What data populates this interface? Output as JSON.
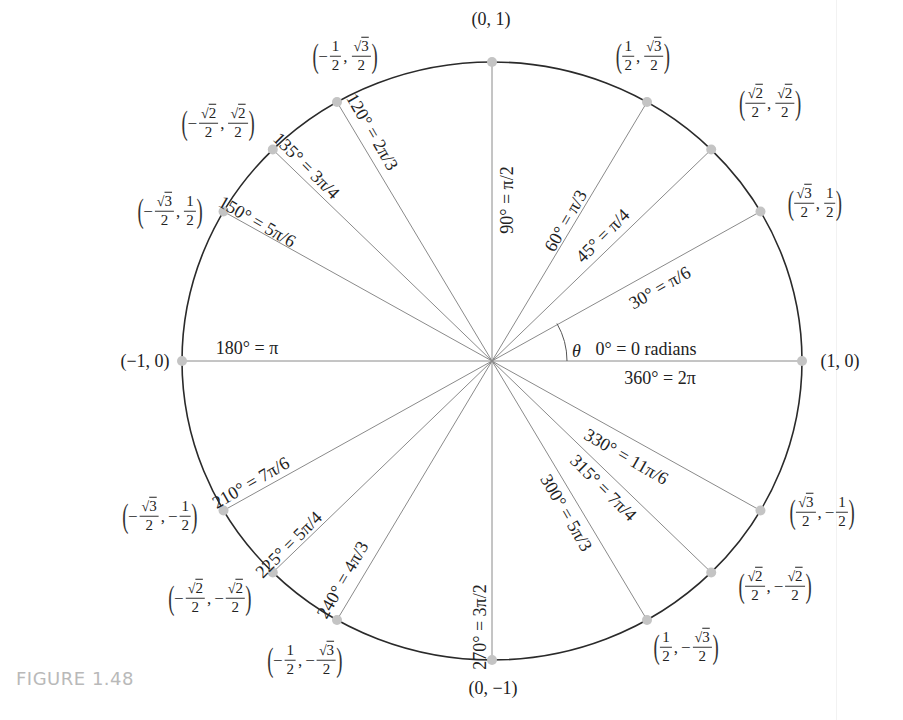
{
  "figure": {
    "caption": "FIGURE 1.48",
    "theta_label": "θ"
  },
  "circle": {
    "center_px": [
      492,
      361
    ],
    "radius_x_px": 310,
    "radius_y_px": 299,
    "stroke_color": "#2a2a2a",
    "ray_color": "#8a8a8a",
    "point_color": "#c4c4c4"
  },
  "chart_data": {
    "type": "diagram",
    "points": [
      {
        "deg": 0,
        "rad": "0 radians",
        "label": "0° = 0 radians",
        "coord": "(1, 0)"
      },
      {
        "deg": 30,
        "rad": "π/6",
        "label": "30° = π/6",
        "coord": "(√3/2, 1/2)"
      },
      {
        "deg": 45,
        "rad": "π/4",
        "label": "45° = π/4",
        "coord": "(√2/2, √2/2)"
      },
      {
        "deg": 60,
        "rad": "π/3",
        "label": "60° = π/3",
        "coord": "(1/2, √3/2)"
      },
      {
        "deg": 90,
        "rad": "π/2",
        "label": "90° = π/2",
        "coord": "(0, 1)"
      },
      {
        "deg": 120,
        "rad": "2π/3",
        "label": "120° = 2π/3",
        "coord": "(−1/2, √3/2)"
      },
      {
        "deg": 135,
        "rad": "3π/4",
        "label": "135° = 3π/4",
        "coord": "(−√2/2, √2/2)"
      },
      {
        "deg": 150,
        "rad": "5π/6",
        "label": "150° = 5π/6",
        "coord": "(−√3/2, 1/2)"
      },
      {
        "deg": 180,
        "rad": "π",
        "label": "180° = π",
        "coord": "(−1, 0)"
      },
      {
        "deg": 210,
        "rad": "7π/6",
        "label": "210° = 7π/6",
        "coord": "(−√3/2, −1/2)"
      },
      {
        "deg": 225,
        "rad": "5π/4",
        "label": "225° = 5π/4",
        "coord": "(−√2/2, −√2/2)"
      },
      {
        "deg": 240,
        "rad": "4π/3",
        "label": "240° = 4π/3",
        "coord": "(−1/2, −√3/2)"
      },
      {
        "deg": 270,
        "rad": "3π/2",
        "label": "270° = 3π/2",
        "coord": "(0, −1)"
      },
      {
        "deg": 300,
        "rad": "5π/3",
        "label": "300° = 5π/3",
        "coord": "(1/2, −√3/2)"
      },
      {
        "deg": 315,
        "rad": "7π/4",
        "label": "315° = 7π/4",
        "coord": "(√2/2, −√2/2)"
      },
      {
        "deg": 330,
        "rad": "11π/6",
        "label": "330° = 11π/6",
        "coord": "(√3/2, −1/2)"
      },
      {
        "deg": 360,
        "rad": "2π",
        "label": "360° = 2π",
        "coord": "(1, 0)"
      }
    ]
  },
  "angle_labels": [
    {
      "text": "0° = 0 radians",
      "x": 646,
      "y": 349,
      "rot": 0
    },
    {
      "text": "360° = 2π",
      "x": 660,
      "y": 378,
      "rot": 0
    },
    {
      "text": "30° = π/6",
      "x": 660,
      "y": 288,
      "rot": -30
    },
    {
      "text": "45° = π/4",
      "x": 603,
      "y": 236,
      "rot": -45
    },
    {
      "text": "60° = π/3",
      "x": 566,
      "y": 221,
      "rot": -60
    },
    {
      "text": "90° = π/2",
      "x": 507,
      "y": 200,
      "rot": -90
    },
    {
      "text": "120° = 2π/3",
      "x": 372,
      "y": 132,
      "rot": 60
    },
    {
      "text": "135° = 3π/4",
      "x": 306,
      "y": 166,
      "rot": 45
    },
    {
      "text": "150° = 5π/6",
      "x": 257,
      "y": 222,
      "rot": 30
    },
    {
      "text": "180° = π",
      "x": 247,
      "y": 348,
      "rot": 0
    },
    {
      "text": "210° = 7π/6",
      "x": 251,
      "y": 483,
      "rot": -30
    },
    {
      "text": "225° = 5π/4",
      "x": 289,
      "y": 545,
      "rot": -45
    },
    {
      "text": "240° = 4π/3",
      "x": 343,
      "y": 580,
      "rot": -60
    },
    {
      "text": "270° = 3π/2",
      "x": 480,
      "y": 627,
      "rot": -90
    },
    {
      "text": "300° = 5π/3",
      "x": 566,
      "y": 513,
      "rot": 60
    },
    {
      "text": "315° = 7π/4",
      "x": 603,
      "y": 488,
      "rot": 45
    },
    {
      "text": "330° = 11π/6",
      "x": 626,
      "y": 457,
      "rot": 30
    }
  ],
  "coords": [
    {
      "id": "p0",
      "x": 840,
      "y": 361,
      "type": "plain",
      "text": "(1, 0)"
    },
    {
      "id": "p90",
      "x": 491,
      "y": 19,
      "type": "plain",
      "text": "(0, 1)"
    },
    {
      "id": "p180",
      "x": 145,
      "y": 361,
      "type": "plain",
      "text": "(−1, 0)"
    },
    {
      "id": "p270",
      "x": 493,
      "y": 688,
      "type": "plain",
      "text": "(0, −1)"
    },
    {
      "id": "p30",
      "x": 815,
      "y": 203,
      "type": "frac",
      "xneg": false,
      "xnum": "√3",
      "yneg": false,
      "ynum": "1"
    },
    {
      "id": "p45",
      "x": 770,
      "y": 103,
      "type": "frac",
      "xneg": false,
      "xnum": "√2",
      "yneg": false,
      "ynum": "√2"
    },
    {
      "id": "p60",
      "x": 643,
      "y": 56,
      "type": "frac",
      "xneg": false,
      "xnum": "1",
      "yneg": false,
      "ynum": "√3"
    },
    {
      "id": "p120",
      "x": 345,
      "y": 56,
      "type": "frac",
      "xneg": true,
      "xnum": "1",
      "yneg": false,
      "ynum": "√3"
    },
    {
      "id": "p135",
      "x": 218,
      "y": 123,
      "type": "frac",
      "xneg": true,
      "xnum": "√2",
      "yneg": false,
      "ynum": "√2"
    },
    {
      "id": "p150",
      "x": 170,
      "y": 211,
      "type": "frac",
      "xneg": true,
      "xnum": "√3",
      "yneg": false,
      "ynum": "1"
    },
    {
      "id": "p210",
      "x": 160,
      "y": 516,
      "type": "frac",
      "xneg": true,
      "xnum": "√3",
      "yneg": true,
      "ynum": "1"
    },
    {
      "id": "p225",
      "x": 210,
      "y": 598,
      "type": "frac",
      "xneg": true,
      "xnum": "√2",
      "yneg": true,
      "ynum": "√2"
    },
    {
      "id": "p240",
      "x": 305,
      "y": 660,
      "type": "frac",
      "xneg": true,
      "xnum": "1",
      "yneg": true,
      "ynum": "√3"
    },
    {
      "id": "p300",
      "x": 686,
      "y": 647,
      "type": "frac",
      "xneg": false,
      "xnum": "1",
      "yneg": true,
      "ynum": "√3"
    },
    {
      "id": "p315",
      "x": 775,
      "y": 586,
      "type": "frac",
      "xneg": false,
      "xnum": "√2",
      "yneg": true,
      "ynum": "√2"
    },
    {
      "id": "p330",
      "x": 822,
      "y": 512,
      "type": "frac",
      "xneg": false,
      "xnum": "√3",
      "yneg": true,
      "ynum": "1"
    }
  ]
}
